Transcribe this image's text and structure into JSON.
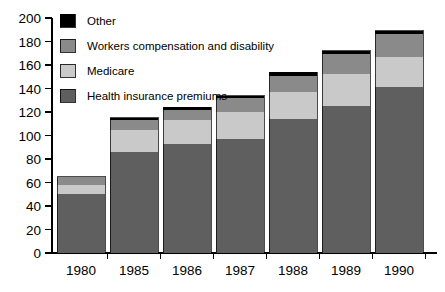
{
  "chart_data": {
    "type": "bar",
    "subtype": "stacked-bar",
    "title": "",
    "subtitle": "",
    "xlabel": "",
    "ylabel": "",
    "categories": [
      "1980",
      "1985",
      "1986",
      "1987",
      "1988",
      "1989",
      "1990"
    ],
    "ylim": [
      0,
      200
    ],
    "ytick_step": 20,
    "ytick_labels": [
      "0",
      "20",
      "40",
      "60",
      "80",
      "100",
      "120",
      "140",
      "160",
      "180",
      "200"
    ],
    "ytick_values": [
      0,
      20,
      40,
      60,
      80,
      100,
      120,
      140,
      160,
      180,
      200
    ],
    "grid": false,
    "legend_position": "top-left-inside",
    "stack_order_bottom_to_top": [
      "Health insurance premiums",
      "Medicare",
      "Workers compensation and disability",
      "Other"
    ],
    "series": [
      {
        "name": "Health insurance premiums",
        "color": "#5f5f5f",
        "values": [
          50,
          86,
          93,
          97,
          114,
          125,
          141
        ]
      },
      {
        "name": "Medicare",
        "color": "#c9c9c9",
        "values": [
          8,
          19,
          20,
          23,
          23,
          27,
          26
        ]
      },
      {
        "name": "Workers compensation and disability",
        "color": "#8a8a8a",
        "values": [
          7,
          8,
          9,
          12,
          14,
          17,
          19
        ]
      },
      {
        "name": "Other",
        "color": "#000000",
        "values": [
          0,
          2,
          2,
          2,
          3,
          3,
          3
        ]
      }
    ],
    "totals": [
      65,
      115,
      124,
      134,
      154,
      172,
      189
    ],
    "legend_entries": [
      {
        "label": "Other",
        "color": "#000000"
      },
      {
        "label": "Workers compensation and disability",
        "color": "#8a8a8a"
      },
      {
        "label": "Medicare",
        "color": "#c9c9c9"
      },
      {
        "label": "Health insurance premiums",
        "color": "#5f5f5f"
      }
    ]
  },
  "colors": {
    "other": "#000000",
    "workers_comp": "#8a8a8a",
    "medicare": "#c9c9c9",
    "health_premiums": "#5f5f5f",
    "axis": "#000000",
    "background": "#ffffff"
  },
  "yaxis": {
    "labels": [
      "200",
      "180",
      "160",
      "140",
      "120",
      "100",
      "80",
      "60",
      "40",
      "20",
      "0"
    ]
  },
  "xaxis": {
    "labels": [
      "1980",
      "1985",
      "1986",
      "1987",
      "1988",
      "1989",
      "1990"
    ]
  },
  "legend": {
    "items": [
      "Other",
      "Workers compensation and disability",
      "Medicare",
      "Health insurance premiums"
    ]
  }
}
